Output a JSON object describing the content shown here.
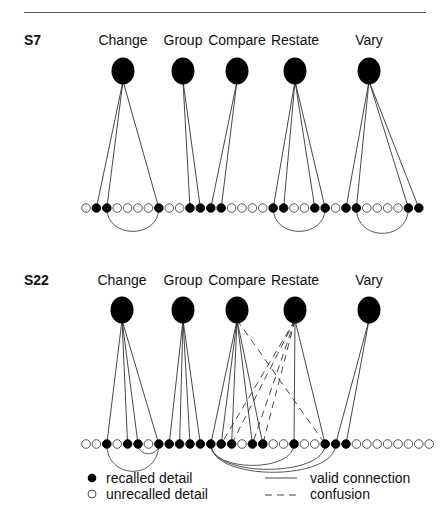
{
  "layout": {
    "detail_start_x": 86,
    "detail_step": 10.4,
    "detail_r": 4.3
  },
  "panels": [
    {
      "id": "S7",
      "label": "S7",
      "label_y": 45,
      "node_y": 71,
      "row_y": 208,
      "categories": [
        {
          "name": "Change",
          "x": 123
        },
        {
          "name": "Group",
          "x": 183
        },
        {
          "name": "Compare",
          "x": 237
        },
        {
          "name": "Restate",
          "x": 295
        },
        {
          "name": "Vary",
          "x": 369
        }
      ],
      "details": "○●●○○○○●○○●●●●○○○○●●○○●●○●●○○○○●●",
      "valid": [
        [
          0,
          1
        ],
        [
          0,
          2
        ],
        [
          0,
          7
        ],
        [
          1,
          10
        ],
        [
          1,
          11
        ],
        [
          2,
          12
        ],
        [
          2,
          13
        ],
        [
          3,
          18
        ],
        [
          3,
          19
        ],
        [
          3,
          22
        ],
        [
          3,
          23
        ],
        [
          4,
          25
        ],
        [
          4,
          26
        ],
        [
          4,
          31
        ],
        [
          4,
          32
        ]
      ],
      "confusion": [],
      "arcs": [
        [
          2,
          7,
          24
        ],
        [
          18,
          23,
          24
        ],
        [
          26,
          31,
          26
        ]
      ]
    },
    {
      "id": "S22",
      "label": "S22",
      "label_y": 285,
      "node_y": 310,
      "row_y": 444,
      "categories": [
        {
          "name": "Change",
          "x": 122
        },
        {
          "name": "Group",
          "x": 183
        },
        {
          "name": "Compare",
          "x": 237
        },
        {
          "name": "Restate",
          "x": 295
        },
        {
          "name": "Vary",
          "x": 369
        }
      ],
      "details": "○○●○●●○●●●●●●●●○●●○○●○○●●●○○○○○○○○",
      "valid": [
        [
          0,
          2
        ],
        [
          0,
          4
        ],
        [
          0,
          5
        ],
        [
          0,
          7
        ],
        [
          1,
          8
        ],
        [
          1,
          9
        ],
        [
          1,
          10
        ],
        [
          1,
          11
        ],
        [
          2,
          12
        ],
        [
          2,
          13
        ],
        [
          2,
          14
        ],
        [
          2,
          16
        ],
        [
          2,
          17
        ],
        [
          3,
          20
        ],
        [
          3,
          23
        ],
        [
          4,
          24
        ],
        [
          4,
          25
        ]
      ],
      "confusion": [
        [
          2,
          23
        ],
        [
          3,
          13
        ],
        [
          3,
          14
        ],
        [
          3,
          16
        ],
        [
          3,
          17
        ]
      ],
      "arcs": [
        [
          2,
          7,
          28
        ],
        [
          5,
          7,
          10
        ],
        [
          12,
          20,
          22
        ],
        [
          12,
          23,
          26
        ],
        [
          12,
          24,
          29
        ]
      ]
    }
  ],
  "legend": {
    "recalled_label": "recalled detail",
    "unrecalled_label": "unrecalled detail",
    "valid_label": "valid connection",
    "confusion_label": "confusion"
  }
}
